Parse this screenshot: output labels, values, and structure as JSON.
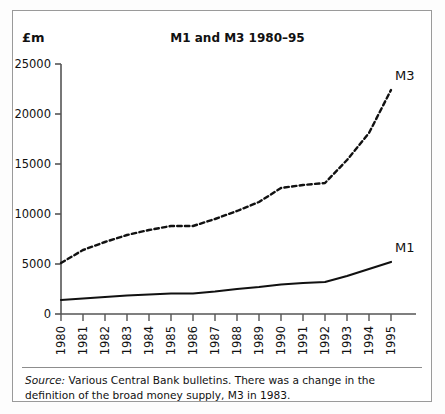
{
  "figure": {
    "unit_label": "£m",
    "title": "M1 and M3 1980–95",
    "source_prefix": "Source:",
    "source_text": " Various Central Bank bulletins. There was a change in the definition of the broad money supply, M3 in 1983."
  },
  "chart_data": {
    "type": "line",
    "title": "M1 and M3 1980–95",
    "xlabel": "",
    "ylabel": "£m",
    "ylim": [
      0,
      25000
    ],
    "yticks": [
      0,
      5000,
      10000,
      15000,
      20000,
      25000
    ],
    "ytick_labels": [
      "0",
      "5000",
      "10000",
      "15000",
      "20000",
      "25000"
    ],
    "grid": false,
    "legend_position": "inline-end-of-line",
    "categories": [
      "1980",
      "1981",
      "1982",
      "1983",
      "1984",
      "1985",
      "1986",
      "1987",
      "1988",
      "1989",
      "1990",
      "1991",
      "1992",
      "1993",
      "1994",
      "1995"
    ],
    "series": [
      {
        "name": "M3",
        "style": "dashed",
        "color": "#111111",
        "values": [
          5100,
          6400,
          7200,
          7900,
          8400,
          8800,
          8800,
          9500,
          10300,
          11200,
          12600,
          12900,
          13100,
          15400,
          18100,
          22400
        ]
      },
      {
        "name": "M1",
        "style": "solid",
        "color": "#111111",
        "values": [
          1400,
          1550,
          1700,
          1850,
          1950,
          2050,
          2050,
          2250,
          2500,
          2700,
          2950,
          3100,
          3200,
          3800,
          4500,
          5200
        ]
      }
    ],
    "annotations": [
      {
        "text": "M3",
        "series": "M3",
        "at_category": "1995"
      },
      {
        "text": "M1",
        "series": "M1",
        "at_category": "1995"
      }
    ]
  }
}
